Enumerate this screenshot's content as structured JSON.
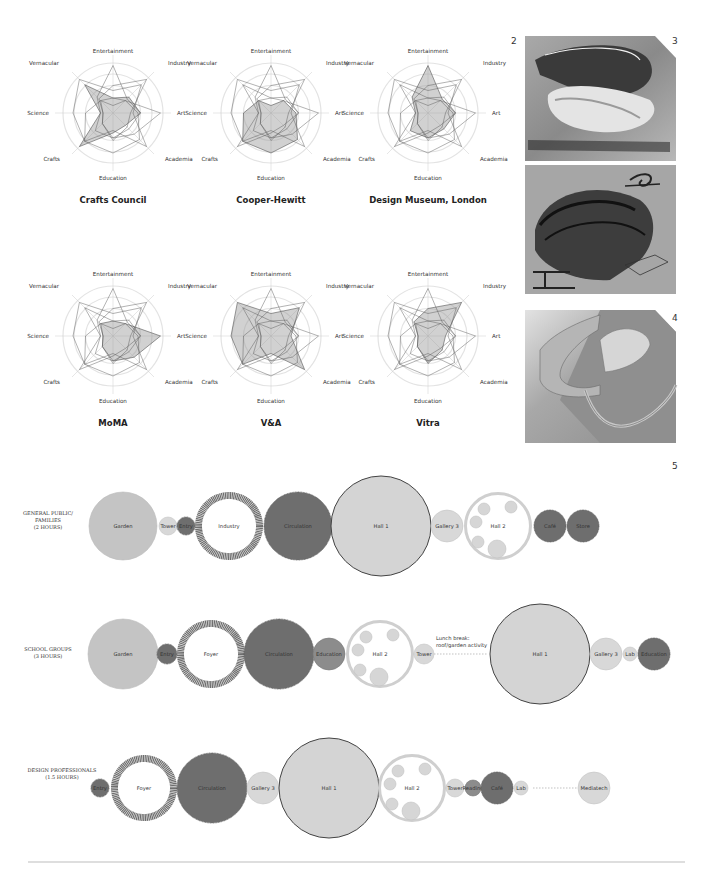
{
  "figure_numbers": {
    "fig2": "2",
    "fig3": "3",
    "fig4": "4",
    "fig5": "5"
  },
  "radar": {
    "axes": [
      "Entertainment",
      "Industry",
      "Art",
      "Academia",
      "Education",
      "Crafts",
      "Science",
      "Vernacular"
    ],
    "charts": [
      {
        "title": "Crafts Council",
        "values": [
          0.3,
          0.45,
          0.55,
          0.35,
          0.4,
          0.95,
          0.25,
          0.8
        ]
      },
      {
        "title": "Cooper-Hewitt",
        "values": [
          0.15,
          0.35,
          0.5,
          0.75,
          0.8,
          0.8,
          0.55,
          0.35
        ]
      },
      {
        "title": "Design Museum, London",
        "values": [
          0.95,
          0.4,
          0.55,
          0.45,
          0.5,
          0.5,
          0.25,
          0.45
        ]
      },
      {
        "title": "MoMA",
        "values": [
          0.3,
          0.35,
          0.95,
          0.6,
          0.5,
          0.3,
          0.2,
          0.35
        ]
      },
      {
        "title": "V&A",
        "values": [
          0.45,
          0.8,
          0.4,
          0.95,
          0.35,
          0.8,
          0.8,
          0.95
        ]
      },
      {
        "title": "Vitra",
        "values": [
          0.55,
          0.95,
          0.35,
          0.4,
          0.55,
          0.3,
          0.2,
          0.4
        ]
      }
    ]
  },
  "chart_data": [
    {
      "type": "radar",
      "title": "Crafts Council",
      "categories": [
        "Entertainment",
        "Industry",
        "Art",
        "Academia",
        "Education",
        "Crafts",
        "Science",
        "Vernacular"
      ],
      "values": [
        0.3,
        0.45,
        0.55,
        0.35,
        0.4,
        0.95,
        0.25,
        0.8
      ],
      "rings": 3
    },
    {
      "type": "radar",
      "title": "Cooper-Hewitt",
      "categories": [
        "Entertainment",
        "Industry",
        "Art",
        "Academia",
        "Education",
        "Crafts",
        "Science",
        "Vernacular"
      ],
      "values": [
        0.15,
        0.35,
        0.5,
        0.75,
        0.8,
        0.8,
        0.55,
        0.35
      ],
      "rings": 3
    },
    {
      "type": "radar",
      "title": "Design Museum, London",
      "categories": [
        "Entertainment",
        "Industry",
        "Art",
        "Academia",
        "Education",
        "Crafts",
        "Science",
        "Vernacular"
      ],
      "values": [
        0.95,
        0.4,
        0.55,
        0.45,
        0.5,
        0.5,
        0.25,
        0.45
      ],
      "rings": 3
    },
    {
      "type": "radar",
      "title": "MoMA",
      "categories": [
        "Entertainment",
        "Industry",
        "Art",
        "Academia",
        "Education",
        "Crafts",
        "Science",
        "Vernacular"
      ],
      "values": [
        0.3,
        0.35,
        0.95,
        0.6,
        0.5,
        0.3,
        0.2,
        0.35
      ],
      "rings": 3
    },
    {
      "type": "radar",
      "title": "V&A",
      "categories": [
        "Entertainment",
        "Industry",
        "Art",
        "Academia",
        "Education",
        "Crafts",
        "Science",
        "Vernacular"
      ],
      "values": [
        0.45,
        0.8,
        0.4,
        0.95,
        0.35,
        0.8,
        0.8,
        0.95
      ],
      "rings": 3
    },
    {
      "type": "radar",
      "title": "Vitra",
      "categories": [
        "Entertainment",
        "Industry",
        "Art",
        "Academia",
        "Education",
        "Crafts",
        "Science",
        "Vernacular"
      ],
      "values": [
        0.55,
        0.95,
        0.35,
        0.4,
        0.55,
        0.3,
        0.2,
        0.4
      ],
      "rings": 3
    }
  ],
  "journeys": {
    "rows": [
      {
        "label_lines": [
          "GENERAL PUBLIC/",
          "FAMILIES",
          "(2 HOURS)"
        ],
        "nodes": [
          {
            "label": "Garden",
            "style": "light"
          },
          {
            "label": "Tower",
            "style": "pale"
          },
          {
            "label": "Entry",
            "style": "dark"
          },
          {
            "label": "Industry",
            "style": "dark-ring"
          },
          {
            "label": "Circulation",
            "style": "dark"
          },
          {
            "label": "Hall 1",
            "style": "hall"
          },
          {
            "label": "Gallery 3",
            "style": "pale"
          },
          {
            "label": "Hall 2",
            "style": "hall2"
          },
          {
            "label": "Café",
            "style": "dark"
          },
          {
            "label": "Store",
            "style": "dark"
          }
        ]
      },
      {
        "label_lines": [
          "SCHOOL GROUPS",
          "(3 HOURS)"
        ],
        "nodes": [
          {
            "label": "Garden",
            "style": "light"
          },
          {
            "label": "Entry",
            "style": "dark"
          },
          {
            "label": "Foyer",
            "style": "dark-ring"
          },
          {
            "label": "Circulation",
            "style": "dark"
          },
          {
            "label": "Education",
            "style": "mid"
          },
          {
            "label": "Hall 2",
            "style": "hall2"
          },
          {
            "label": "Tower",
            "style": "pale"
          },
          {
            "label": "Hall 1",
            "style": "hall"
          },
          {
            "label": "Gallery 3",
            "style": "pale"
          },
          {
            "label": "Lab",
            "style": "pale"
          },
          {
            "label": "Education",
            "style": "dark"
          }
        ],
        "note_lines": [
          "Lunch break:",
          "roof/garden activity"
        ]
      },
      {
        "label_lines": [
          "DESIGN PROFESSIONALS",
          "(1.5 HOURS)"
        ],
        "nodes": [
          {
            "label": "Entry",
            "style": "dark"
          },
          {
            "label": "Foyer",
            "style": "dark-ring"
          },
          {
            "label": "Circulation",
            "style": "dark"
          },
          {
            "label": "Gallery 3",
            "style": "pale"
          },
          {
            "label": "Hall 1",
            "style": "hall"
          },
          {
            "label": "Hall 2",
            "style": "hall2"
          },
          {
            "label": "Tower",
            "style": "pale"
          },
          {
            "label": "Reading",
            "style": "mid"
          },
          {
            "label": "Café",
            "style": "dark"
          },
          {
            "label": "Lab",
            "style": "pale"
          },
          {
            "label": "Mediatech",
            "style": "pale"
          }
        ]
      }
    ]
  },
  "colors": {
    "dark": "#6e6e6e",
    "mid": "#8c8c8c",
    "light": "#c4c4c4",
    "pale": "#d8d8d8",
    "ring": "#cfcfcf",
    "hall_fill": "#d4d4d4",
    "hall_stroke": "#444444",
    "radar_fill": "#9a9a9a",
    "radar_grid": "#e3e3e3"
  }
}
